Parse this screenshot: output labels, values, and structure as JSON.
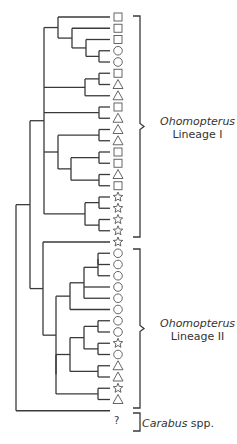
{
  "diagram": {
    "type": "phylogenetic-tree",
    "tip_start_y": 17,
    "tip_spacing": 11.25,
    "tip_x": 110,
    "symbol_x": 118,
    "tips": [
      "square",
      "square",
      "square",
      "circle",
      "circle",
      "square",
      "triangle",
      "triangle",
      "square",
      "triangle",
      "triangle",
      "triangle",
      "square",
      "square",
      "triangle",
      "square",
      "star",
      "star",
      "star",
      "star",
      "star",
      "circle",
      "circle",
      "circle",
      "circle",
      "circle",
      "circle",
      "circle",
      "circle",
      "star",
      "circle",
      "triangle",
      "triangle",
      "star",
      "triangle",
      "question"
    ],
    "unknown_tip_label": "?",
    "groups": [
      {
        "name": "Ohomopterus",
        "suffix": "Lineage I",
        "from": 0,
        "to": 19
      },
      {
        "name": "Ohomopterus",
        "suffix": "Lineage II",
        "from": 21,
        "to": 34
      },
      {
        "name": "Carabus",
        "suffix": "spp.",
        "from": 35,
        "to": 35
      }
    ]
  },
  "labels": {
    "lineage1_genus": "Ohomopterus",
    "lineage1_name": "Lineage I",
    "lineage2_genus": "Ohomopterus",
    "lineage2_name": "Lineage II",
    "outgroup_genus": "Carabus",
    "outgroup_suffix": " spp.",
    "unknown": "?"
  }
}
